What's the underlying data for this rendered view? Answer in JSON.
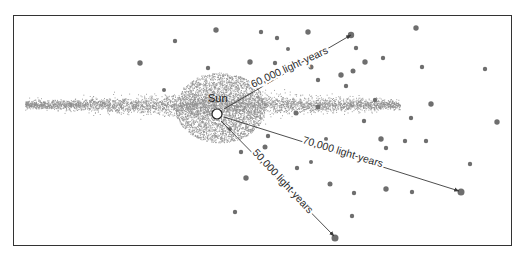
{
  "diagram": {
    "frame": {
      "x": 13,
      "y": 15,
      "width": 499,
      "height": 231,
      "border_color": "#333333"
    },
    "colors": {
      "galaxy_dots": "#6b6b6b",
      "stars": "#6e6e6e",
      "lines": "#3a3a3a",
      "text": "#2b2b2b"
    },
    "galaxy": {
      "disk": {
        "x_start": 25,
        "x_end": 400,
        "center_y": 105
      },
      "bulge": {
        "cx": 220,
        "cy": 108,
        "rx": 45,
        "ry": 35
      }
    },
    "sun": {
      "label": "Sun",
      "cx": 217,
      "cy": 114,
      "r": 5
    },
    "distance_arrows": [
      {
        "id": "arrow-60000",
        "label": "60,000 light-years",
        "from": [
          224,
          109
        ],
        "to": [
          351,
          35
        ],
        "label_x": 253,
        "label_y": 88,
        "angle": -25
      },
      {
        "id": "arrow-70000",
        "label": "70,000 light-years",
        "from": [
          224,
          117
        ],
        "to": [
          459,
          191
        ],
        "label_x": 302,
        "label_y": 143,
        "angle": 17
      },
      {
        "id": "arrow-50000",
        "label": "50,000 light-years",
        "from": [
          221,
          121
        ],
        "to": [
          334,
          236
        ],
        "label_x": 252,
        "label_y": 153,
        "angle": 47
      }
    ],
    "stars": [
      [
        140,
        63,
        2.7
      ],
      [
        175,
        41,
        2.2
      ],
      [
        216,
        30,
        2.7
      ],
      [
        261,
        32,
        2.2
      ],
      [
        277,
        38,
        2.2
      ],
      [
        308,
        32,
        2.7
      ],
      [
        208,
        68,
        2.2
      ],
      [
        164,
        90,
        2.0
      ],
      [
        250,
        62,
        2.7
      ],
      [
        275,
        63,
        2.2
      ],
      [
        288,
        49,
        2.0
      ],
      [
        292,
        64,
        2.7
      ],
      [
        311,
        67,
        2.5
      ],
      [
        318,
        80,
        2.2
      ],
      [
        341,
        75,
        2.7
      ],
      [
        346,
        86,
        2.2
      ],
      [
        365,
        62,
        2.7
      ],
      [
        356,
        48,
        2.2
      ],
      [
        353,
        71,
        2.5
      ],
      [
        383,
        58,
        2.2
      ],
      [
        416,
        28,
        2.7
      ],
      [
        422,
        67,
        2.2
      ],
      [
        431,
        104,
        2.7
      ],
      [
        485,
        69,
        2.2
      ],
      [
        497,
        122,
        2.7
      ],
      [
        426,
        141,
        2.2
      ],
      [
        470,
        164,
        2.2
      ],
      [
        318,
        107,
        2.5
      ],
      [
        364,
        121,
        2.2
      ],
      [
        296,
        113,
        2.5
      ],
      [
        268,
        136,
        2.2
      ],
      [
        265,
        147,
        2.5
      ],
      [
        326,
        139,
        2.0
      ],
      [
        381,
        139,
        2.7
      ],
      [
        386,
        148,
        2.2
      ],
      [
        405,
        141,
        2.2
      ],
      [
        386,
        189,
        2.7
      ],
      [
        412,
        192,
        2.2
      ],
      [
        352,
        216,
        2.2
      ],
      [
        297,
        168,
        2.2
      ],
      [
        311,
        162,
        2.0
      ],
      [
        241,
        152,
        2.2
      ],
      [
        246,
        178,
        2.7
      ],
      [
        235,
        212,
        2.2
      ],
      [
        330,
        184,
        2.5
      ],
      [
        354,
        193,
        2.2
      ],
      [
        230,
        129,
        2.0
      ],
      [
        375,
        100,
        2.2
      ],
      [
        411,
        118,
        2.2
      ]
    ],
    "targets": [
      [
        351,
        35,
        3.2
      ],
      [
        461,
        192,
        3.5
      ],
      [
        335,
        238,
        3.5
      ]
    ]
  }
}
